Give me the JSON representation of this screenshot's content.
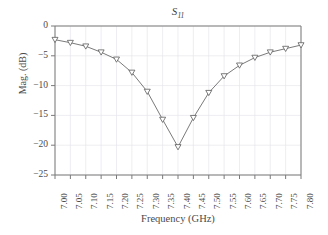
{
  "chart_data": {
    "type": "line",
    "title": "S11",
    "title_base": "S",
    "title_sub": "11",
    "xlabel": "Frequency (GHz)",
    "ylabel": "Mag. (dB)",
    "xlim": [
      7.0,
      7.8
    ],
    "ylim": [
      -25,
      0
    ],
    "grid": true,
    "grid_axis": "both",
    "legend": null,
    "legend_position": "none",
    "marker": "triangle-down",
    "line_color": "#6b6b6b",
    "marker_color": "#5a5a5a",
    "grid_color": "#e2e2ea",
    "axis_color": "#7a7a7a",
    "x": [
      7.0,
      7.05,
      7.1,
      7.15,
      7.2,
      7.25,
      7.3,
      7.35,
      7.4,
      7.45,
      7.5,
      7.55,
      7.6,
      7.65,
      7.7,
      7.75,
      7.8
    ],
    "values": [
      -2.3,
      -2.8,
      -3.4,
      -4.4,
      -5.6,
      -7.8,
      -11.0,
      -15.7,
      -20.3,
      -15.4,
      -11.2,
      -8.4,
      -6.6,
      -5.3,
      -4.4,
      -3.8,
      -3.2
    ],
    "xticks": [
      7.0,
      7.05,
      7.1,
      7.15,
      7.2,
      7.25,
      7.3,
      7.35,
      7.4,
      7.45,
      7.5,
      7.55,
      7.6,
      7.65,
      7.7,
      7.75,
      7.8
    ],
    "xticklabels": [
      "7.00",
      "7.05",
      "7.10",
      "7.15",
      "7.20",
      "7.25",
      "7.30",
      "7.35",
      "7.40",
      "7.45",
      "7.50",
      "7.55",
      "7.60",
      "7.65",
      "7.70",
      "7.75",
      "7.80"
    ],
    "yticks": [
      0,
      -5,
      -10,
      -15,
      -20,
      -25
    ],
    "yticklabels": [
      "0",
      "−5",
      "−10",
      "−15",
      "−20",
      "−25"
    ]
  }
}
